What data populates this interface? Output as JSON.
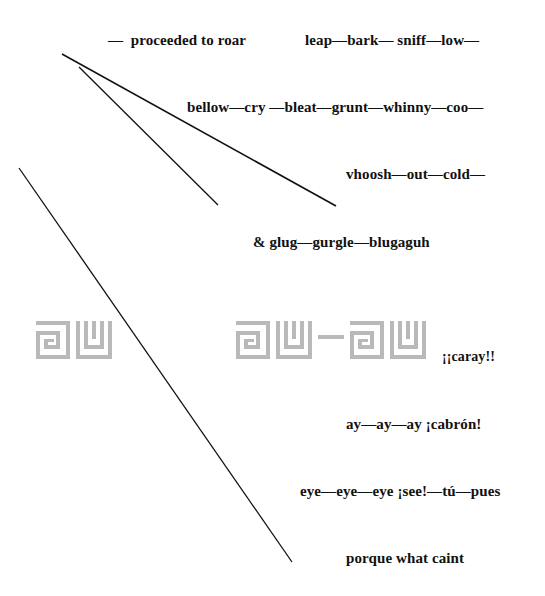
{
  "poem": {
    "lines": [
      {
        "id": "l1a",
        "text": "—  proceeded to roar",
        "x": 108,
        "y": 33
      },
      {
        "id": "l1b",
        "text": "leap—bark— sniff—low—",
        "x": 305,
        "y": 33
      },
      {
        "id": "l2",
        "text": "bellow—cry —bleat—grunt—whinny—coo—",
        "x": 187,
        "y": 99
      },
      {
        "id": "l3",
        "text": "vhoosh—out—cold—",
        "x": 346,
        "y": 166
      },
      {
        "id": "l4",
        "text": "& glug—gurgle—blugaguh",
        "x": 253,
        "y": 234
      },
      {
        "id": "l5",
        "text": "¡¡caray!!",
        "x": 442,
        "y": 348
      },
      {
        "id": "l6",
        "text": "ay—ay—ay ¡cabrón!",
        "x": 346,
        "y": 415
      },
      {
        "id": "l7",
        "text": "eye—eye—eye ¡see!—tú—pues",
        "x": 300,
        "y": 482
      },
      {
        "id": "l8",
        "text": "porque what caint",
        "x": 346,
        "y": 549
      }
    ]
  },
  "decorations": {
    "stroke_color": "#111111",
    "glyph_color": "#b8b8b8",
    "diagonal_lines": [
      {
        "name": "diagonal-line-long-upper",
        "x1": 62,
        "y1": 54,
        "x2": 336,
        "y2": 206
      },
      {
        "name": "diagonal-line-short-upper",
        "x1": 79,
        "y1": 67,
        "x2": 218,
        "y2": 205
      },
      {
        "name": "diagonal-line-long-lower",
        "x1": 19,
        "y1": 168,
        "x2": 292,
        "y2": 562
      }
    ],
    "glyph_groups": [
      {
        "name": "meander-glyph-pair-left",
        "glyphs": [
          "a",
          "w"
        ],
        "x": 36,
        "y": 322
      },
      {
        "name": "meander-glyph-pair-right",
        "glyphs": [
          "a",
          "w",
          "dash",
          "a",
          "w"
        ],
        "x": 236,
        "y": 322
      }
    ]
  }
}
